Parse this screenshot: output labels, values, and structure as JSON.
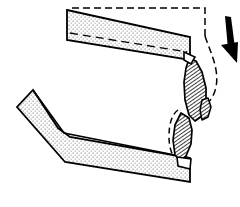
{
  "figure": {
    "title": "Structural band fracture diagram",
    "width": 240,
    "height": 207,
    "background_color": "#ffffff"
  },
  "style": {
    "outline_color": "#000000",
    "stipple_dot_color": "#808080",
    "stipple_fill_color": "#ffffff",
    "hatch_line_color": "#000000",
    "hatch_fill_color": "#ffffff",
    "dashed_line_color": "#000000",
    "arrow_fill_color": "#000000",
    "outline_width": 1.6,
    "dash_pattern": "7,4",
    "hatch_spacing": 3,
    "stipple_spacing": 4
  },
  "elements": {
    "upper_band": {
      "name": "upper-stippled-band",
      "fill": "stipple",
      "points": "67,10 190,37 190,60 67,40",
      "crease_line": "70,33 188,53"
    },
    "lower_band": {
      "name": "lower-bent-stippled-band",
      "fill": "stipple",
      "points": "33,90 17,107 65,162 190,182 190,158 70,137 58,128",
      "bend_top": "33,90 65,124 190,158",
      "bend_bottom": "17,107 63,160"
    },
    "fragment_upper": {
      "name": "upper-hatched-fracture-fragment",
      "fill": "hatch",
      "points": "189,60 196,62 203,76 206,94 205,108 199,119 192,121 186,112 184,95 185,76"
    },
    "fragment_lower": {
      "name": "lower-hatched-fracture-fragment",
      "fill": "hatch",
      "points": "181,112 188,116 191,128 190,143 185,155 179,160 174,155 172,141 174,126"
    },
    "fragment_sliver": {
      "name": "fracture-sliver",
      "fill": "hatch",
      "points": "200,108 206,104 209,112 207,120 202,122"
    },
    "dashed_outline_top": {
      "name": "dashed-original-outline-top",
      "path": "M 72,8 L 205,8 L 205,36"
    },
    "dashed_outline_right": {
      "name": "dashed-original-outline-right",
      "path": "M 205,36 C 209,48 214,58 216,70 C 218,82 216,92 211,99 C 206,106 201,110 199,116"
    },
    "dashed_outline_lower": {
      "name": "dashed-original-outline-lower",
      "path": "M 178,110 C 172,114 169,124 169,136 C 169,148 172,156 177,161"
    },
    "arrow": {
      "name": "downward-load-arrow",
      "label": "applied load direction",
      "direction": "down",
      "shaft": "228,18 232,44",
      "head": "237,62 222,46 234,44"
    },
    "joint_upper": {
      "name": "upper-band-joint-notch",
      "points": "186,54 196,58 192,64 186,62"
    },
    "joint_lower": {
      "name": "lower-band-joint-notch",
      "points": "180,158 191,160 190,168 179,166"
    }
  }
}
